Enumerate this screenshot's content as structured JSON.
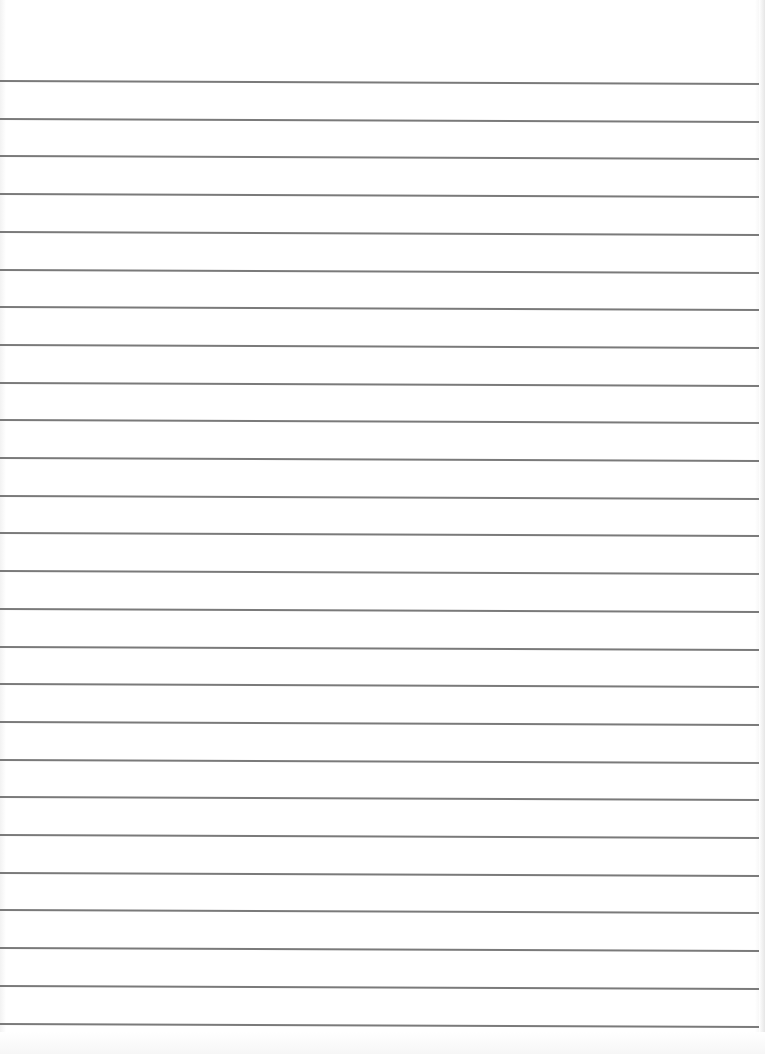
{
  "document": {
    "type": "ruled-paper",
    "background_color": "#ffffff",
    "rule_color": "#7a7a7a",
    "rule_count": 26,
    "first_rule_y": 80,
    "rule_spacing": 37.7,
    "text_content": ""
  }
}
